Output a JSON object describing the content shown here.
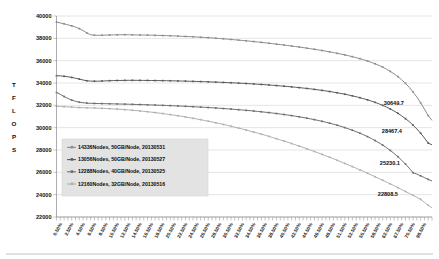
{
  "chart_data": {
    "type": "line",
    "title": "",
    "xlabel": "",
    "ylabel": "TFLOPS",
    "ylim": [
      22000,
      40000
    ],
    "yticks": [
      22000,
      24000,
      26000,
      28000,
      30000,
      32000,
      34000,
      36000,
      38000,
      40000
    ],
    "ytick_labels": [
      "22000",
      "24000",
      "26000",
      "28000",
      "30000",
      "32000",
      "34000",
      "36000",
      "38000",
      "40000"
    ],
    "grid": true,
    "legend_position": "inside-lower-left",
    "xtick_labels": [
      "0.50%",
      "2.50%",
      "4.50%",
      "6.50%",
      "8.50%",
      "10.50%",
      "12.50%",
      "14.50%",
      "16.50%",
      "18.50%",
      "20.50%",
      "22.50%",
      "24.50%",
      "26.50%",
      "28.50%",
      "30.50%",
      "32.50%",
      "34.50%",
      "36.50%",
      "38.50%",
      "40.50%",
      "42.50%",
      "44.50%",
      "46.50%",
      "48.50%",
      "51.50%",
      "52.50%",
      "55.50%",
      "58.50%",
      "62.50%",
      "67.50%",
      "70.50%",
      "98.50%"
    ],
    "series": [
      {
        "name": "14336Nodes, 50GB/Node, 20130531",
        "color": "#8d8d8d",
        "end_label": "30649.7",
        "values": [
          39450,
          39380,
          39300,
          39210,
          39120,
          39010,
          38870,
          38700,
          38480,
          38320,
          38280,
          38270,
          38275,
          38290,
          38300,
          38310,
          38315,
          38320,
          38325,
          38320,
          38310,
          38305,
          38300,
          38295,
          38290,
          38280,
          38270,
          38260,
          38250,
          38240,
          38230,
          38215,
          38200,
          38185,
          38170,
          38155,
          38140,
          38120,
          38100,
          38080,
          38060,
          38035,
          38010,
          37985,
          37960,
          37930,
          37900,
          37870,
          37840,
          37810,
          37780,
          37745,
          37710,
          37675,
          37640,
          37600,
          37560,
          37520,
          37480,
          37440,
          37400,
          37355,
          37310,
          37265,
          37220,
          37170,
          37120,
          37070,
          37020,
          36965,
          36910,
          36850,
          36790,
          36725,
          36660,
          36590,
          36520,
          36440,
          36360,
          36270,
          36180,
          36080,
          35970,
          35850,
          35720,
          35580,
          35420,
          35240,
          35040,
          34820,
          34570,
          34290,
          33970,
          33610,
          33200,
          32740,
          32230,
          31670,
          31080,
          30649.7
        ]
      },
      {
        "name": "13056Nodes, 50GB/Node, 20130527",
        "color": "#5a5a5a",
        "end_label": "28467.4",
        "values": [
          34650,
          34640,
          34600,
          34560,
          34500,
          34430,
          34350,
          34270,
          34200,
          34170,
          34160,
          34165,
          34175,
          34190,
          34205,
          34215,
          34225,
          34230,
          34235,
          34240,
          34240,
          34238,
          34235,
          34232,
          34228,
          34224,
          34220,
          34215,
          34210,
          34205,
          34200,
          34192,
          34184,
          34176,
          34168,
          34158,
          34148,
          34138,
          34128,
          34116,
          34104,
          34092,
          34080,
          34066,
          34052,
          34038,
          34022,
          34006,
          33990,
          33972,
          33954,
          33934,
          33914,
          33892,
          33870,
          33846,
          33822,
          33796,
          33770,
          33742,
          33714,
          33684,
          33652,
          33620,
          33586,
          33550,
          33512,
          33472,
          33430,
          33386,
          33340,
          33290,
          33238,
          33182,
          33124,
          33062,
          32996,
          32926,
          32850,
          32770,
          32684,
          32592,
          32492,
          32384,
          32266,
          32138,
          31998,
          31844,
          31676,
          31490,
          31286,
          31060,
          30810,
          30534,
          30226,
          29884,
          29504,
          29082,
          28614,
          28467.4
        ]
      },
      {
        "name": "12288Nodes, 40GB/Node, 20130525",
        "color": "#6e6e6e",
        "end_label": "25230.1",
        "values": [
          33150,
          32980,
          32790,
          32620,
          32470,
          32360,
          32280,
          32230,
          32200,
          32180,
          32170,
          32162,
          32155,
          32148,
          32140,
          32132,
          32124,
          32116,
          32108,
          32100,
          32090,
          32080,
          32070,
          32060,
          32048,
          32036,
          32024,
          32012,
          32000,
          31986,
          31972,
          31958,
          31944,
          31928,
          31912,
          31896,
          31878,
          31860,
          31842,
          31822,
          31802,
          31782,
          31760,
          31738,
          31714,
          31690,
          31664,
          31638,
          31610,
          31582,
          31552,
          31522,
          31490,
          31456,
          31422,
          31386,
          31348,
          31308,
          31266,
          31222,
          31176,
          31128,
          31078,
          31026,
          30970,
          30912,
          30850,
          30786,
          30718,
          30646,
          30570,
          30490,
          30404,
          30314,
          30218,
          30116,
          30008,
          29894,
          29772,
          29642,
          29504,
          29356,
          29198,
          29028,
          28846,
          28650,
          28438,
          28210,
          27962,
          27694,
          27402,
          27086,
          26742,
          26370,
          25966,
          25840,
          25690,
          25530,
          25370,
          25230.1
        ]
      },
      {
        "name": "12160Nodes, 32GB/Node, 20130516",
        "color": "#b0b0b0",
        "end_label": "22808.5",
        "values": [
          31920,
          31900,
          31880,
          31860,
          31840,
          31820,
          31800,
          31790,
          31780,
          31770,
          31760,
          31745,
          31730,
          31715,
          31700,
          31680,
          31660,
          31640,
          31615,
          31590,
          31560,
          31530,
          31498,
          31464,
          31428,
          31390,
          31350,
          31308,
          31264,
          31218,
          31170,
          31120,
          31068,
          31014,
          30958,
          30900,
          30840,
          30778,
          30714,
          30648,
          30580,
          30510,
          30438,
          30364,
          30288,
          30210,
          30130,
          30048,
          29964,
          29878,
          29790,
          29700,
          29608,
          29514,
          29418,
          29320,
          29220,
          29118,
          29014,
          28908,
          28800,
          28690,
          28578,
          28464,
          28348,
          28230,
          28110,
          27988,
          27864,
          27738,
          27610,
          27480,
          27348,
          27214,
          27078,
          26940,
          26800,
          26658,
          26514,
          26368,
          26220,
          26070,
          25918,
          25764,
          25608,
          25450,
          25290,
          25128,
          24964,
          24798,
          24630,
          24460,
          24288,
          24114,
          23938,
          23760,
          23580,
          23320,
          23050,
          22808.5
        ]
      }
    ]
  }
}
